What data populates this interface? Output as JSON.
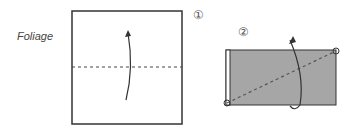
{
  "title": "Foliage",
  "steps": [
    {
      "number": "①",
      "description": "Square paper with horizontal dashed fold line; fold up along center"
    },
    {
      "number": "②",
      "description": "Gray rectangle with diagonal dashed fold line between circled corners; fold behind"
    }
  ],
  "colors": {
    "paper_fill": "#a6a6a6",
    "line": "#333333",
    "background": "#ffffff"
  }
}
